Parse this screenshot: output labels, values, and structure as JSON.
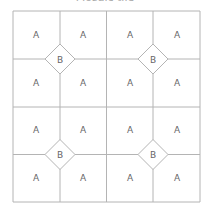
{
  "title": "Mosaic tile",
  "colors": {
    "line": "#b4b4b4",
    "label": "#666666",
    "background": "#ffffff"
  },
  "grid": {
    "cols": 4,
    "rows": 4,
    "x_lines": [
      13,
      60,
      106.5,
      153,
      200
    ],
    "y_lines": [
      11,
      59,
      107,
      154.5,
      202
    ]
  },
  "cells": [
    {
      "label": "A",
      "x": 36,
      "y": 35
    },
    {
      "label": "A",
      "x": 83,
      "y": 35
    },
    {
      "label": "A",
      "x": 130,
      "y": 35
    },
    {
      "label": "A",
      "x": 177,
      "y": 35
    },
    {
      "label": "A",
      "x": 36,
      "y": 83
    },
    {
      "label": "A",
      "x": 83,
      "y": 83
    },
    {
      "label": "A",
      "x": 130,
      "y": 83
    },
    {
      "label": "A",
      "x": 177,
      "y": 83
    },
    {
      "label": "A",
      "x": 36,
      "y": 130
    },
    {
      "label": "A",
      "x": 83,
      "y": 130
    },
    {
      "label": "A",
      "x": 130,
      "y": 130
    },
    {
      "label": "A",
      "x": 177,
      "y": 130
    },
    {
      "label": "A",
      "x": 36,
      "y": 178
    },
    {
      "label": "A",
      "x": 83,
      "y": 178
    },
    {
      "label": "A",
      "x": 130,
      "y": 178
    },
    {
      "label": "A",
      "x": 177,
      "y": 178
    }
  ],
  "diamonds": [
    {
      "label": "B",
      "cx": 60,
      "cy": 59,
      "r": 15
    },
    {
      "label": "B",
      "cx": 153,
      "cy": 59,
      "r": 15
    },
    {
      "label": "B",
      "cx": 60,
      "cy": 154.5,
      "r": 15
    },
    {
      "label": "B",
      "cx": 153,
      "cy": 154.5,
      "r": 15
    }
  ]
}
